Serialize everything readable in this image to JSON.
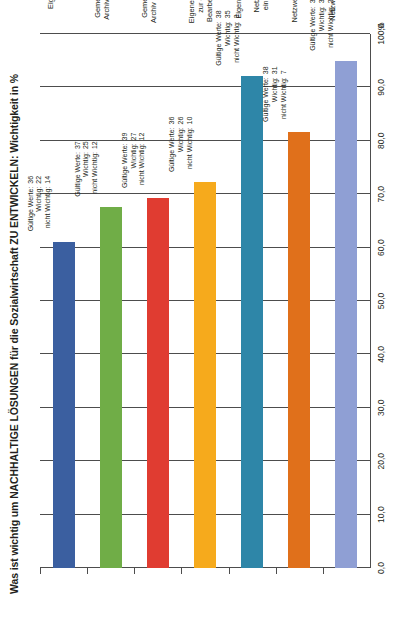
{
  "chart_data": {
    "type": "bar",
    "orientation": "horizontal",
    "title": "Was ist wichtig um NACHHALTIGE LÖSUNGEN für die Sozialwirtschaft ZU ENTWICKELN: Wichtigkeit in %",
    "xlabel": "",
    "ylabel": "%",
    "unit_label": "%",
    "xlim": [
      0,
      100
    ],
    "grid": true,
    "legend": "none",
    "tick_labels": [
      "0,0",
      "10,0",
      "20,0",
      "30,0",
      "40,0",
      "50,0",
      "60,0",
      "70,0",
      "80,0",
      "90,0",
      "100,0"
    ],
    "tick_values": [
      0,
      10,
      20,
      30,
      40,
      50,
      60,
      70,
      80,
      90,
      100
    ],
    "annotation_keys": {
      "valid": "Gültige Werte:",
      "important": "Wichtig:",
      "not_important": "nicht Wichtig:"
    },
    "categories": [
      "Eigene Netzwerk Homepage",
      "Gemeinsames Online-Archiv für Publikationen",
      "Gemeinsames Online-Archiv zur Profilablablage der Akteure",
      "Eigener „Learning Space“ zur gezielten online Bearbeitung div. Themen",
      "Eigener Mailverteiler in den alle Netzwerkmitglieder eingebunden sind",
      "Regionale Netzwerkgruppen Treffen",
      "Netzwerk Fachkongress"
    ],
    "values": [
      61.1,
      67.6,
      69.2,
      72.2,
      92.1,
      81.6,
      94.9
    ],
    "colors": [
      "#3b5fa0",
      "#70ad47",
      "#e03c31",
      "#f6aa1c",
      "#2e86a8",
      "#e0701b",
      "#8f9fd4"
    ],
    "annotations": [
      {
        "valid": "36",
        "important": "22",
        "not_important": "14"
      },
      {
        "valid": "37",
        "important": "25",
        "not_important": "12"
      },
      {
        "valid": "39",
        "important": "27",
        "not_important": "12"
      },
      {
        "valid": "36",
        "important": "26",
        "not_important": "10"
      },
      {
        "valid": "38",
        "important": "35",
        "not_important": "3"
      },
      {
        "valid": "38",
        "important": "31",
        "not_important": "7"
      },
      {
        "valid": "39",
        "important": "37",
        "not_important": "2"
      }
    ]
  }
}
